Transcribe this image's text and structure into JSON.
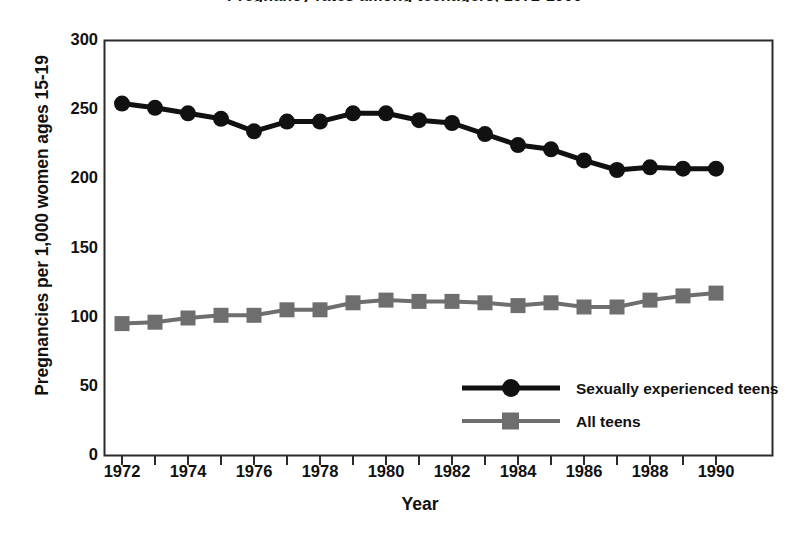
{
  "chart_data": {
    "type": "line",
    "title": "Pregnancy rates among teenagers, 1972-1990",
    "xlabel": "Year",
    "ylabel": "Pregnancies per 1,000 women ages 15-19",
    "x": [
      1972,
      1973,
      1974,
      1975,
      1976,
      1977,
      1978,
      1979,
      1980,
      1981,
      1982,
      1983,
      1984,
      1985,
      1986,
      1987,
      1988,
      1989,
      1990
    ],
    "xlim": [
      1972,
      1990
    ],
    "ylim": [
      0,
      300
    ],
    "yticks": [
      0,
      50,
      100,
      150,
      200,
      250,
      300
    ],
    "xticks": [
      1972,
      1974,
      1976,
      1978,
      1980,
      1982,
      1984,
      1986,
      1988,
      1990
    ],
    "xticklabels": [
      "1972",
      "1974",
      "1976",
      "1978",
      "1980",
      "1982",
      "1984",
      "1986",
      "1988",
      "1990"
    ],
    "yticklabels": [
      "0",
      "50",
      "100",
      "150",
      "200",
      "250",
      "300"
    ],
    "x_minor_ticks": [
      1973,
      1975,
      1977,
      1979,
      1981,
      1983,
      1985,
      1987,
      1989
    ],
    "grid": false,
    "legend_position": "lower right inside",
    "series": [
      {
        "name": "Sexually experienced teens",
        "marker": "circle",
        "color": "#111111",
        "values": [
          254,
          251,
          247,
          243,
          234,
          241,
          241,
          247,
          247,
          242,
          240,
          232,
          224,
          221,
          213,
          206,
          208,
          207,
          207
        ]
      },
      {
        "name": "All teens",
        "marker": "square",
        "color": "#6e6e6e",
        "values": [
          95,
          96,
          99,
          101,
          101,
          105,
          105,
          110,
          112,
          111,
          111,
          110,
          108,
          110,
          107,
          107,
          112,
          115,
          117
        ]
      }
    ]
  },
  "legend": {
    "items": [
      {
        "label": "Sexually experienced teens"
      },
      {
        "label": "All teens"
      }
    ]
  },
  "axes": {
    "y_title": "Pregnancies per 1,000 women ages 15-19",
    "x_title": "Year"
  }
}
